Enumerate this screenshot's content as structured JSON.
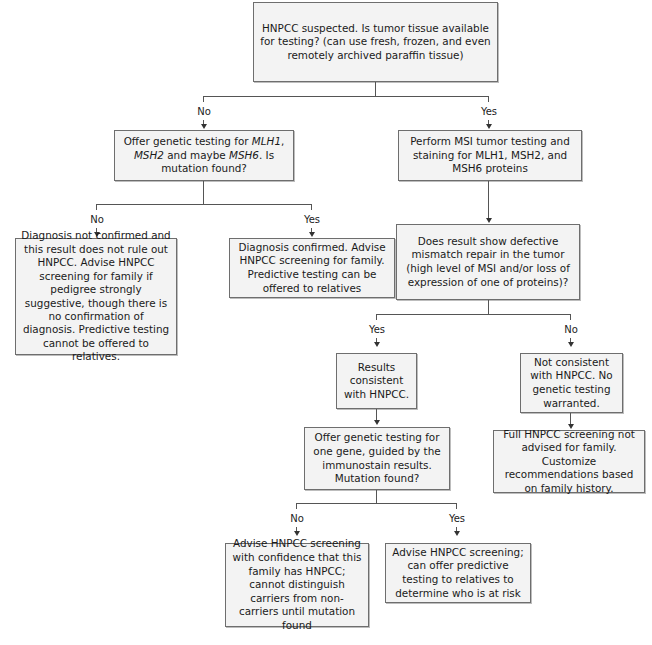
{
  "nodes": {
    "start": {
      "text": "HNPCC suspected. Is tumor tissue available for testing? (can use fresh, frozen, and even remotely archived paraffin tissue)"
    },
    "offer_genetic_testing": {
      "text_parts": [
        "Offer genetic testing for ",
        "MLH1",
        ", ",
        "MSH2",
        " and maybe ",
        "MSH6",
        ".  Is mutation found?"
      ],
      "italic_genes": [
        "MLH1",
        "MSH2",
        "MSH6"
      ]
    },
    "msi_testing": {
      "text": "Perform MSI tumor testing and staining for MLH1, MSH2, and MSH6 proteins"
    },
    "diagnosis_not_confirmed": {
      "text": "Diagnosis not confirmed and this result does not rule out HNPCC. Advise HNPCC screening for family if pedigree strongly suggestive, though there is no confirmation of diagnosis. Predictive testing cannot be offered to relatives."
    },
    "diagnosis_confirmed": {
      "text": "Diagnosis confirmed. Advise HNPCC screening for family. Predictive testing can be offered to relatives"
    },
    "defective_mismatch_repair": {
      "text": "Does result show defective mismatch repair in the tumor (high level of MSI and/or loss of expression of one of proteins)?"
    },
    "results_consistent": {
      "text": "Results consistent with HNPCC."
    },
    "not_consistent": {
      "text": "Not consistent with HNPCC. No genetic testing warranted."
    },
    "offer_one_gene": {
      "text": "Offer genetic testing for one gene,  guided by the immunostain results. Mutation found?"
    },
    "full_screening_not_advised": {
      "text": "Full HNPCC screening not advised for family. Customize recommendations based on family history."
    },
    "advise_with_confidence": {
      "text": "Advise HNPCC screening with confidence that this family has HNPCC; cannot distinguish carriers from non-carriers until mutation found"
    },
    "advise_predictive": {
      "text": "Advise HNPCC screening; can offer predictive testing to relatives to determine who is at risk"
    }
  },
  "edges": {
    "start_no": "No",
    "start_yes": "Yes",
    "genetic_no": "No",
    "genetic_yes": "Yes",
    "mmr_yes": "Yes",
    "mmr_no": "No",
    "one_gene_no": "No",
    "one_gene_yes": "Yes"
  },
  "colors": {
    "box_fill": "#f3f3f3",
    "box_border": "#6e6e6e",
    "connector": "#555555"
  }
}
